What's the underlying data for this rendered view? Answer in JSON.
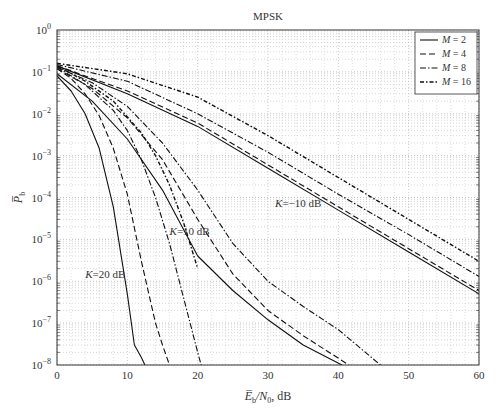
{
  "chart_data": {
    "type": "line",
    "title": "MPSK",
    "xlabel": "E̅b/N0, dB",
    "ylabel": "P̅b",
    "xlim": [
      0,
      60
    ],
    "ylim": [
      1e-08,
      1
    ],
    "yscale": "log",
    "grid": true,
    "legend_position": "upper right",
    "x_ticks": [
      0,
      10,
      20,
      30,
      40,
      50,
      60
    ],
    "x_tick_labels": [
      "0",
      "10",
      "20",
      "30",
      "40",
      "50",
      "60"
    ],
    "y_ticks": [
      1,
      0.1,
      0.01,
      0.001,
      0.0001,
      1e-05,
      1e-06,
      1e-07,
      1e-08
    ],
    "y_tick_labels": [
      "10^0",
      "10^-1",
      "10^-2",
      "10^-3",
      "10^-4",
      "10^-5",
      "10^-6",
      "10^-7",
      "10^-8"
    ],
    "legend": [
      {
        "label": "M = 2",
        "style": "solid"
      },
      {
        "label": "M = 4",
        "style": "dashed"
      },
      {
        "label": "M = 8",
        "style": "dashdot"
      },
      {
        "label": "M = 16",
        "style": "dashdotbold"
      }
    ],
    "annotations": [
      {
        "text": "K=20 dB",
        "x": 4,
        "y": 1.2e-06
      },
      {
        "text": "K=10 dB",
        "x": 16,
        "y": 1.3e-05
      },
      {
        "text": "K=−10 dB",
        "x": 31,
        "y": 6e-05
      }
    ],
    "series": [
      {
        "name": "M = 2, K = 20 dB",
        "style": "solid",
        "x": [
          0,
          2,
          4,
          6,
          8,
          10,
          11,
          12,
          12.5
        ],
        "y": [
          0.08,
          0.035,
          0.01,
          0.0015,
          6e-05,
          5e-07,
          3e-08,
          1.5e-08,
          1e-08
        ]
      },
      {
        "name": "M = 4, K = 20 dB",
        "style": "dashed",
        "x": [
          0,
          2,
          4,
          6,
          8,
          10,
          12,
          14,
          15,
          16
        ],
        "y": [
          0.12,
          0.07,
          0.03,
          0.009,
          0.0015,
          0.00012,
          3e-06,
          1e-07,
          3e-08,
          1e-08
        ]
      },
      {
        "name": "M = 8, K = 20 dB",
        "style": "dashdot",
        "x": [
          0,
          4,
          8,
          10,
          12,
          14,
          16,
          18,
          20,
          20.5
        ],
        "y": [
          0.13,
          0.05,
          0.012,
          0.004,
          0.0008,
          0.0001,
          8e-06,
          4e-07,
          2e-08,
          1e-08
        ]
      },
      {
        "name": "M = 16, K = 20 dB",
        "style": "dashdotbold",
        "x": [
          0,
          4,
          8,
          12,
          14,
          16,
          18,
          20
        ],
        "y": [
          0.14,
          0.06,
          0.02,
          0.0035,
          0.001,
          0.0002,
          2.5e-05,
          2e-06
        ]
      },
      {
        "name": "M = 2, K = 10 dB",
        "style": "solid",
        "x": [
          0,
          5,
          10,
          15,
          20,
          25,
          30,
          35,
          40.5
        ],
        "y": [
          0.09,
          0.02,
          0.0025,
          0.00015,
          4e-06,
          6e-07,
          1.2e-07,
          3e-08,
          1e-08
        ]
      },
      {
        "name": "M = 4, K = 10 dB",
        "style": "dashed",
        "x": [
          0,
          5,
          10,
          15,
          20,
          25,
          30,
          35,
          41.5
        ],
        "y": [
          0.12,
          0.04,
          0.008,
          0.0008,
          3e-05,
          1.5e-06,
          2e-07,
          5e-08,
          1e-08
        ]
      },
      {
        "name": "M = 8, K = 10 dB",
        "style": "dashdot",
        "x": [
          0,
          5,
          10,
          15,
          20,
          25,
          30,
          35,
          40,
          46
        ],
        "y": [
          0.13,
          0.055,
          0.015,
          0.002,
          0.00015,
          8e-06,
          1e-06,
          2.5e-07,
          7e-08,
          1e-08
        ]
      },
      {
        "name": "M = 2, K = −10 dB",
        "style": "solid",
        "x": [
          0,
          10,
          20,
          30,
          40,
          50,
          60
        ],
        "y": [
          0.14,
          0.03,
          0.005,
          0.0005,
          5e-05,
          5e-06,
          5e-07
        ]
      },
      {
        "name": "M = 4, K = −10 dB",
        "style": "dashed",
        "x": [
          0,
          10,
          20,
          30,
          40,
          50,
          60
        ],
        "y": [
          0.14,
          0.035,
          0.006,
          0.0006,
          6e-05,
          6e-06,
          6e-07
        ]
      },
      {
        "name": "M = 8, K = −10 dB",
        "style": "dashdot",
        "x": [
          0,
          10,
          20,
          30,
          40,
          50,
          60
        ],
        "y": [
          0.15,
          0.06,
          0.01,
          0.0012,
          0.00012,
          1.3e-05,
          1.3e-06
        ]
      },
      {
        "name": "M = 16, K = −10 dB",
        "style": "dashdotbold",
        "x": [
          0,
          10,
          20,
          30,
          40,
          50,
          60
        ],
        "y": [
          0.16,
          0.09,
          0.025,
          0.003,
          0.0003,
          3e-05,
          3e-06
        ]
      }
    ]
  }
}
